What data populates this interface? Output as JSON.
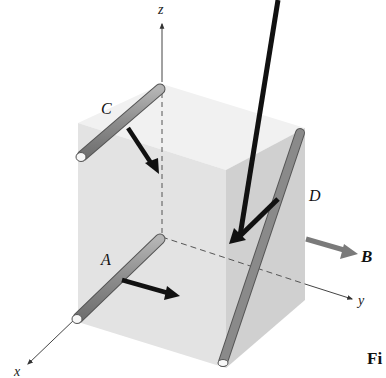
{
  "figure": {
    "axes": {
      "x_label": "x",
      "y_label": "y",
      "z_label": "z"
    },
    "bars": [
      {
        "id": "A",
        "label": "A",
        "force_direction": "along +y"
      },
      {
        "id": "B",
        "label": "B",
        "force_direction": "along +y (outside cube)"
      },
      {
        "id": "C",
        "label": "C",
        "force_direction": "downward into top face"
      },
      {
        "id": "D",
        "label": "D",
        "force_direction": "toward -y, downward"
      }
    ],
    "caption_fragment": "Fi",
    "colors": {
      "cube_front": "#e4e4e4",
      "cube_top": "#f1f1f1",
      "cube_right": "#cfcfcf",
      "rod_fill": "#8a8a8a",
      "rod_end": "#f7f7f7",
      "force_arrow": "#111111",
      "arrow_B": "#7a7a7a",
      "axis": "#444444"
    }
  }
}
